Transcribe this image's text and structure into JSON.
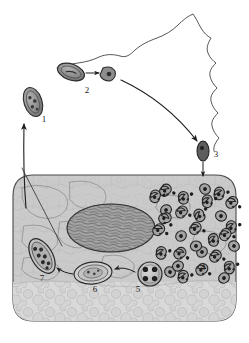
{
  "figure": {
    "background_color": "#ffffff",
    "ink_color": "#1c1c1c"
  },
  "host_cell": {
    "name": "epithelial host cell",
    "cytoplasm_color": "#cfcfcf",
    "membrane_color": "#4a4a4a",
    "nucleus": {
      "name": "nucleus",
      "fill_color": "#9a9a9a",
      "texture": "striated-chromatin"
    },
    "vacuole_zone": {
      "name": "basal vacuolated cytoplasm",
      "fill_color": "#d6d6d6"
    }
  },
  "extracellular": {
    "mucosa_outline": {
      "name": "mucosal-surface-outline",
      "stroke_color": "#3a3a3a"
    }
  },
  "labels": [
    {
      "id": "1",
      "text": "1",
      "name": "label-1-elementary-body-released",
      "x": 44,
      "y": 122
    },
    {
      "id": "2",
      "text": "2",
      "name": "label-2-attachment-entry",
      "x": 87,
      "y": 93
    },
    {
      "id": "3",
      "text": "3",
      "name": "label-3-endocytosis",
      "x": 216,
      "y": 157
    },
    {
      "id": "4",
      "text": "4",
      "name": "label-4-reticulate-bodies-dividing",
      "x": 203,
      "y": 270
    },
    {
      "id": "5",
      "text": "5",
      "name": "label-5-inclusion-with-particles",
      "x": 138,
      "y": 292
    },
    {
      "id": "6",
      "text": "6",
      "name": "label-6-maturing-inclusion",
      "x": 95,
      "y": 292
    },
    {
      "id": "7",
      "text": "7",
      "name": "label-7-mature-inclusion",
      "x": 42,
      "y": 281
    }
  ],
  "particles": {
    "elementary_body_1": {
      "name": "elementary-body-stage-1",
      "cx": 33,
      "cy": 102,
      "rx": 9,
      "ry": 15,
      "rotation": -18,
      "fill_color": "#8c8c8c"
    },
    "elementary_body_2": {
      "name": "elementary-body-stage-2",
      "cx": 71,
      "cy": 72,
      "rx": 13,
      "ry": 8,
      "rotation": 22,
      "fill_color": "#8a8a8a"
    },
    "attached_body_2b": {
      "name": "attached-body-stage-2",
      "cx": 108,
      "cy": 74,
      "r": 7,
      "fill_color": "#8d8d8d"
    },
    "endocytosed_body_3": {
      "name": "internalised-body-stage-3",
      "cx": 203,
      "cy": 151,
      "rx": 6,
      "ry": 10,
      "fill_color": "#5f5f5f"
    },
    "inclusion_5": {
      "name": "inclusion-stage-5",
      "cx": 150,
      "cy": 274,
      "r": 12,
      "fill_color": "#9b9b9b",
      "inner_dot_count": 4
    },
    "inclusion_6": {
      "name": "inclusion-stage-6",
      "cx": 93,
      "cy": 273,
      "rx": 19,
      "ry": 11,
      "fill_color": "#c6c6c6"
    },
    "inclusion_7": {
      "name": "inclusion-stage-7",
      "cx": 42,
      "cy": 256,
      "rx": 10,
      "ry": 18,
      "rotation": -28,
      "fill_color": "#b5b5b5"
    }
  },
  "reticulate_body_count": 30,
  "arrows": [
    {
      "name": "arrow-2-to-attachment",
      "from": "elementary_body_2",
      "to": "attached_body_2b"
    },
    {
      "name": "arrow-attachment-to-3",
      "from": "attached_body_2b",
      "to": "endocytosed_body_3"
    },
    {
      "name": "arrow-3-into-cell",
      "from": "endocytosed_body_3",
      "to": "cytoplasm"
    },
    {
      "name": "arrow-5-to-6",
      "from": "inclusion_5",
      "to": "inclusion_6"
    },
    {
      "name": "arrow-6-to-7",
      "from": "inclusion_6",
      "to": "inclusion_7"
    },
    {
      "name": "arrow-release-to-1",
      "from": "cytoplasm",
      "to": "elementary_body_1"
    }
  ]
}
